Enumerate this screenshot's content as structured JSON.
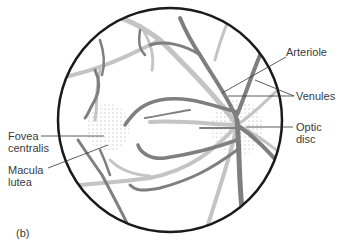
{
  "figure": {
    "panel_label": "(b)",
    "labels": {
      "arteriole": "Arteriole",
      "venules": "Venules",
      "optic_disc_line1": "Optic",
      "optic_disc_line2": "disc",
      "fovea_line1": "Fovea",
      "fovea_line2": "centralis",
      "macula_line1": "Macula",
      "macula_line2": "lutea"
    },
    "colors": {
      "outline": "#1a1a1a",
      "venule": "#7f7f7f",
      "arteriole": "#c4c4c4",
      "leader": "#333333"
    }
  }
}
